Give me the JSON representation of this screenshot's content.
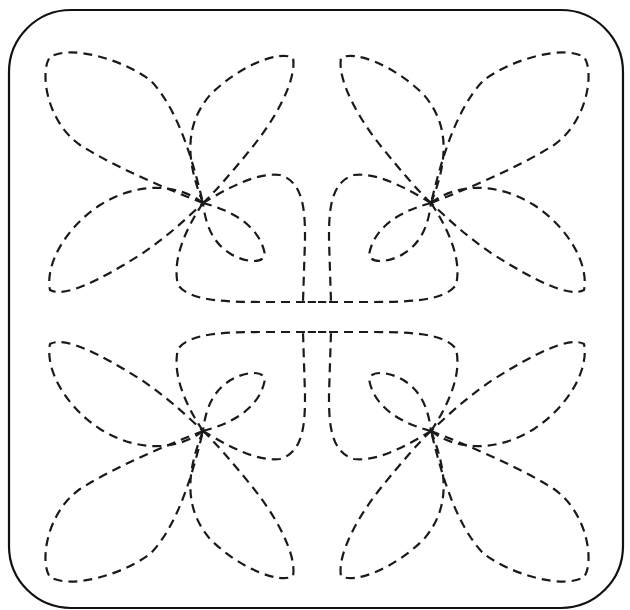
{
  "pattern": {
    "title": "Quilting stitch pattern – four-flower block",
    "frame": {
      "x": 9,
      "y": 10,
      "width": 614,
      "height": 598,
      "radius": 62,
      "stroke": "#111111"
    },
    "stitch_color": "#1a1a1a",
    "stitch_style": "dashed",
    "symmetry": "4-fold mirror around block center",
    "center": [
      316,
      317
    ],
    "flowers": [
      {
        "name": "top-left",
        "center": [
          203,
          203
        ]
      },
      {
        "name": "top-right",
        "center": [
          430,
          207
        ]
      },
      {
        "name": "bottom-left",
        "center": [
          203,
          428
        ]
      },
      {
        "name": "bottom-right",
        "center": [
          430,
          430
        ]
      }
    ],
    "petals_per_flower": 4,
    "connecting_loops": "each flower has a loop joining the central crossed square"
  }
}
